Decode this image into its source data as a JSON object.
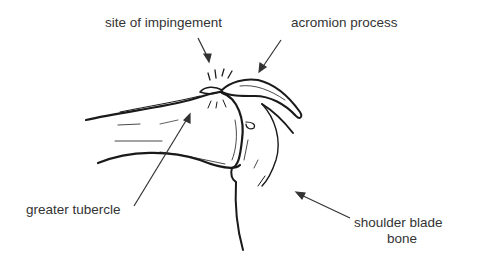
{
  "diagram": {
    "labels": {
      "site_of_impingement": "site of impingement",
      "acromion_process": "acromion process",
      "greater_tubercle": "greater tubercle",
      "shoulder_blade_line1": "shoulder blade",
      "shoulder_blade_line2": "bone"
    },
    "colors": {
      "ink": "#1a1a1a",
      "text": "#333333",
      "background": "#ffffff"
    }
  }
}
